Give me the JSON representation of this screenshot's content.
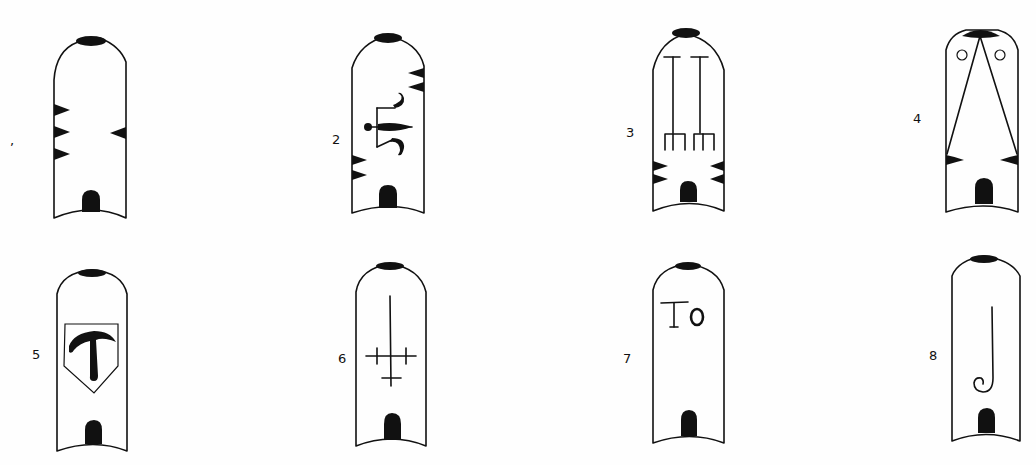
{
  "figures": [
    {
      "id": 1,
      "label": ",",
      "motif": "three left notches and one right notch"
    },
    {
      "id": 2,
      "label": "2",
      "motif": "balance / lily sign with notches"
    },
    {
      "id": 3,
      "label": "3",
      "motif": "two standards with forked bases"
    },
    {
      "id": 4,
      "label": "4",
      "motif": "converging lines with two circles"
    },
    {
      "id": 5,
      "label": "5",
      "motif": "shield with tau-anchor mark"
    },
    {
      "id": 6,
      "label": "6",
      "motif": "inverted cross with crossbars"
    },
    {
      "id": 7,
      "label": "7",
      "motif": "letters",
      "text": "To"
    },
    {
      "id": 8,
      "label": "8",
      "motif": "crozier / hooked staff"
    }
  ],
  "colors": {
    "ink": "#111111",
    "paper": "#fefefe"
  }
}
